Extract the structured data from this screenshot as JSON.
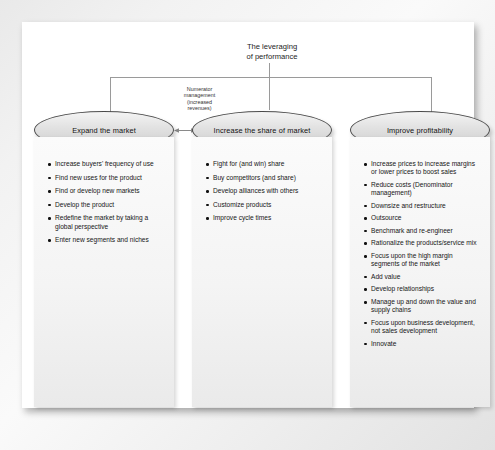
{
  "title": "The leveraging\nof performance",
  "connector_label": "Numerator\nmanagement\n(increased\nrevenues)",
  "nodes": [
    {
      "id": "expand",
      "label": "Expand the market"
    },
    {
      "id": "share",
      "label": "Increase the share of market"
    },
    {
      "id": "profit",
      "label": "Improve profitability"
    }
  ],
  "columns": [
    {
      "id": "expand-the-market",
      "items": [
        "Increase buyers' frequency of use",
        "Find new uses for the product",
        "Find or develop new markets",
        "Develop the product",
        "Redefine the market by taking a global perspective",
        "Enter new segments and niches"
      ]
    },
    {
      "id": "increase-the-share-of-market",
      "items": [
        "Fight for (and win) share",
        "Buy competitors (and share)",
        "Develop alliances with others",
        "Customize products",
        "Improve cycle times"
      ]
    },
    {
      "id": "improve-profitability",
      "items": [
        "Increase prices to increase margins or lower prices to boost sales",
        "Reduce costs (Denominator management)",
        "Downsize and restructure",
        "Outsource",
        "Benchmark and re-engineer",
        "Rationalize the products/service mix",
        "Focus upon the high margin segments of the market",
        "Add value",
        "Develop relationships",
        "Manage up and down the value and supply chains",
        "Focus upon business development, not sales development",
        "Innovate"
      ]
    }
  ],
  "colors": {
    "node_outline": "#4a4a4a",
    "connector": "#9a9a9a",
    "text": "#161616",
    "page": "#ffffff"
  }
}
